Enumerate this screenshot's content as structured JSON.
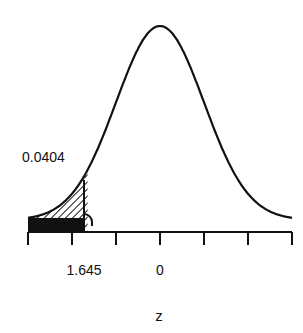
{
  "chart_data": {
    "type": "area",
    "title": "",
    "xlabel": "z",
    "ylabel": "",
    "xlim": [
      -3,
      3
    ],
    "x_ticks": [
      -3,
      -2,
      -1,
      0,
      1,
      2,
      3
    ],
    "tick_labels": [
      {
        "x": -1.645,
        "label": "1.645"
      },
      {
        "x": 0,
        "label": "0"
      }
    ],
    "shaded_region": {
      "from": -3,
      "to": -1.645,
      "area_label": "0.0404"
    },
    "annotations": [
      "0.0404"
    ],
    "grid": false,
    "legend": null
  },
  "labels": {
    "area": "0.0404",
    "critical": "1.645",
    "zero": "0",
    "axis": "z"
  },
  "colors": {
    "curve": "#111111",
    "shade": "#111111",
    "background": "#ffffff"
  }
}
